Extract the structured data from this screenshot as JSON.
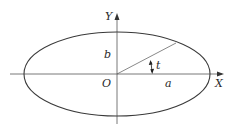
{
  "diagram": {
    "type": "ellipse-parametric",
    "labels": {
      "y_axis": "Y",
      "x_axis": "X",
      "origin": "O",
      "semi_minor": "b",
      "semi_major": "a",
      "parameter": "t"
    },
    "colors": {
      "stroke": "#3a3a3a",
      "text": "#2a2a2a",
      "background": "#ffffff"
    }
  }
}
